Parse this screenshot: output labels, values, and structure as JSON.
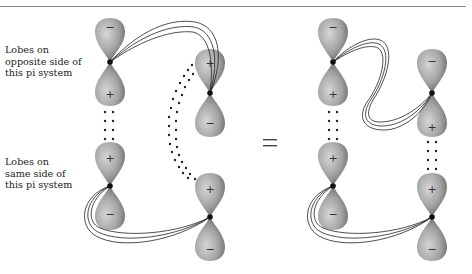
{
  "figure": {
    "labels": {
      "opposite": [
        "Lobes on",
        "opposite side of",
        "this pi system"
      ],
      "same": [
        "Lobes on",
        "same side of",
        "this pi system"
      ]
    },
    "equals": "=",
    "colors": {
      "lobe_light": "#cfcfcf",
      "lobe_mid": "#9a9a9a",
      "lobe_dark": "#555555",
      "ribbon": "#222222",
      "dots": "#222222",
      "rule": "#8a8a8a"
    },
    "left_diagram": {
      "orbitals": [
        {
          "id": "A1",
          "upper_sign": "−",
          "lower_sign": "+"
        },
        {
          "id": "A2",
          "upper_sign": "+",
          "lower_sign": "−"
        },
        {
          "id": "B1",
          "upper_sign": "+",
          "lower_sign": "−"
        },
        {
          "id": "B2",
          "upper_sign": "+",
          "lower_sign": "−"
        }
      ]
    },
    "right_diagram": {
      "orbitals": [
        {
          "id": "C1",
          "upper_sign": "−",
          "lower_sign": "+"
        },
        {
          "id": "C2",
          "upper_sign": "+",
          "lower_sign": "−"
        },
        {
          "id": "D1",
          "upper_sign": "−",
          "lower_sign": "+"
        },
        {
          "id": "D2",
          "upper_sign": "+",
          "lower_sign": "−"
        }
      ]
    }
  }
}
